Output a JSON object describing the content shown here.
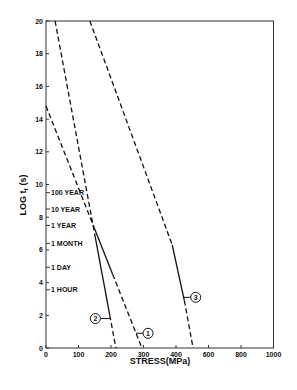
{
  "chart_data": {
    "type": "line",
    "title": "",
    "xlabel": "STRESS(MPa)",
    "ylabel": "LOG t_f (s)",
    "ylabel_main": "LOG t",
    "ylabel_sub": "f",
    "ylabel_unit": "(s)",
    "xlim": [
      0,
      1000
    ],
    "ylim": [
      0,
      20
    ],
    "x_ticks": [
      "0",
      "100",
      "200",
      "300",
      "400",
      "600",
      "800",
      "1000"
    ],
    "y_ticks": [
      "0",
      "2",
      "4",
      "6",
      "8",
      "10",
      "12",
      "14",
      "16",
      "18",
      "20"
    ],
    "grid": false,
    "legend": "none",
    "time_annotations": [
      {
        "label": "100 YEAR",
        "log_t": 9.5
      },
      {
        "label": "10 YEAR",
        "log_t": 8.5
      },
      {
        "label": "1 YEAR",
        "log_t": 7.5
      },
      {
        "label": "1 MONTH",
        "log_t": 6.4
      },
      {
        "label": "1 DAY",
        "log_t": 4.94
      },
      {
        "label": "1 HOUR",
        "log_t": 3.56
      }
    ],
    "series": [
      {
        "name": "1",
        "x": [
          0,
          295
        ],
        "y": [
          14.8,
          0
        ],
        "solid_range_y": [
          4.5,
          7.3
        ],
        "label_point": {
          "x": 300,
          "y": 0.9
        }
      },
      {
        "name": "2",
        "x": [
          28,
          215
        ],
        "y": [
          20,
          0
        ],
        "solid_range_y": [
          2.0,
          7.0
        ],
        "label_point": {
          "x": 160,
          "y": 1.8
        }
      },
      {
        "name": "3",
        "x": [
          135,
          505
        ],
        "y": [
          20,
          0
        ],
        "solid_range_y": [
          2.9,
          6.3
        ],
        "label_point": {
          "x": 470,
          "y": 3.1
        }
      }
    ]
  }
}
